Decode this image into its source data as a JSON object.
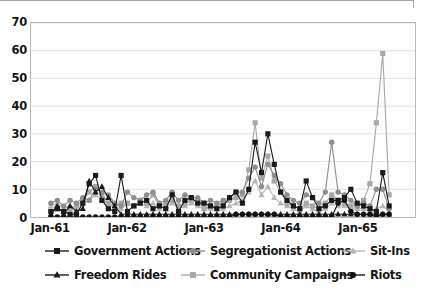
{
  "chart_data": {
    "type": "line",
    "title": "",
    "xlabel": "",
    "ylabel": "",
    "ylim": [
      0,
      70
    ],
    "ytick_step": 10,
    "yticks": [
      "0",
      "10",
      "20",
      "30",
      "40",
      "50",
      "60",
      "70"
    ],
    "xticks": [
      "Jan-61",
      "Jan-62",
      "Jan-63",
      "Jan-64",
      "Jan-65"
    ],
    "xtick_positions": [
      0,
      12,
      24,
      36,
      48
    ],
    "grid": "horizontal",
    "legend_position": "bottom",
    "x_range": [
      0,
      53
    ],
    "x_count": 54,
    "series": [
      {
        "name": "Government Actions",
        "marker": "square",
        "color": "#1a1a1a",
        "line_color": "#1a1a1a",
        "values": [
          2,
          3,
          2,
          1,
          1,
          5,
          12,
          15,
          6,
          3,
          2,
          15,
          2,
          4,
          5,
          6,
          3,
          4,
          3,
          8,
          2,
          6,
          7,
          5,
          5,
          4,
          3,
          4,
          7,
          9,
          5,
          10,
          27,
          16,
          30,
          19,
          9,
          6,
          4,
          3,
          13,
          7,
          3,
          4,
          6,
          6,
          7,
          10,
          5,
          4,
          3,
          2,
          16,
          4
        ]
      },
      {
        "name": "Segregationist Actions",
        "marker": "circle",
        "color": "#8e8e8e",
        "line_color": "#8e8e8e",
        "values": [
          5,
          6,
          4,
          6,
          5,
          7,
          6,
          10,
          9,
          8,
          5,
          4,
          9,
          7,
          6,
          8,
          9,
          5,
          6,
          9,
          6,
          8,
          7,
          7,
          5,
          6,
          5,
          6,
          7,
          9,
          9,
          14,
          18,
          11,
          19,
          15,
          12,
          8,
          6,
          5,
          8,
          7,
          5,
          9,
          27,
          9,
          8,
          6,
          4,
          5,
          4,
          10,
          10,
          3
        ]
      },
      {
        "name": "Sit-Ins",
        "marker": "triangle",
        "color": "#b6b6b6",
        "line_color": "#b6b6b6",
        "values": [
          4,
          5,
          3,
          4,
          3,
          5,
          6,
          8,
          6,
          5,
          3,
          3,
          5,
          4,
          5,
          4,
          5,
          3,
          4,
          5,
          3,
          4,
          5,
          4,
          3,
          3,
          3,
          3,
          4,
          5,
          6,
          9,
          13,
          8,
          11,
          7,
          5,
          4,
          3,
          2,
          4,
          3,
          2,
          3,
          5,
          4,
          4,
          3,
          3,
          3,
          2,
          3,
          4,
          2
        ]
      },
      {
        "name": "Freedom Rides",
        "marker": "triangle",
        "color": "#1a1a1a",
        "line_color": "#1a1a1a",
        "values": [
          1,
          4,
          1,
          4,
          2,
          3,
          13,
          9,
          11,
          7,
          4,
          1,
          1,
          1,
          1,
          1,
          1,
          1,
          1,
          1,
          1,
          1,
          1,
          1,
          1,
          1,
          1,
          1,
          1,
          1,
          1,
          1,
          1,
          1,
          1,
          1,
          1,
          1,
          1,
          1,
          1,
          1,
          1,
          1,
          1,
          1,
          1,
          1,
          1,
          1,
          1,
          1,
          1,
          1
        ]
      },
      {
        "name": "Community Campaigns",
        "marker": "square",
        "color": "#a8a8a8",
        "line_color": "#a8a8a8",
        "values": [
          2,
          3,
          2,
          3,
          4,
          6,
          9,
          11,
          8,
          5,
          4,
          5,
          5,
          4,
          6,
          5,
          8,
          4,
          5,
          6,
          4,
          5,
          6,
          6,
          3,
          4,
          4,
          5,
          6,
          7,
          8,
          17,
          34,
          14,
          22,
          13,
          9,
          5,
          4,
          3,
          5,
          4,
          3,
          5,
          8,
          6,
          5,
          4,
          4,
          6,
          12,
          34,
          59,
          8
        ]
      },
      {
        "name": "Riots",
        "marker": "circle",
        "color": "#111111",
        "line_color": "#111111",
        "values": [
          0,
          0,
          0,
          0,
          0,
          0,
          0,
          0,
          0,
          0,
          0,
          0,
          0,
          0,
          0,
          0,
          0,
          0,
          0,
          0,
          0,
          0,
          0,
          0,
          0,
          0,
          0,
          0,
          0,
          1,
          1,
          1,
          1,
          1,
          1,
          1,
          0,
          0,
          0,
          0,
          0,
          0,
          0,
          0,
          0,
          5,
          6,
          2,
          1,
          1,
          1,
          0,
          1,
          1
        ]
      }
    ]
  },
  "legend": {
    "items": [
      {
        "label": "Government Actions",
        "marker": "square",
        "color": "#1a1a1a"
      },
      {
        "label": "Segregationist Actions",
        "marker": "circle",
        "color": "#8e8e8e"
      },
      {
        "label": "Sit-Ins",
        "marker": "triangle",
        "color": "#b6b6b6"
      },
      {
        "label": "Freedom Rides",
        "marker": "triangle",
        "color": "#1a1a1a"
      },
      {
        "label": "Community Campaigns",
        "marker": "square",
        "color": "#a8a8a8"
      },
      {
        "label": "Riots",
        "marker": "circle",
        "color": "#111111"
      }
    ],
    "rows": [
      [
        0,
        1,
        2
      ],
      [
        3,
        4,
        5
      ]
    ],
    "column_offsets": [
      44,
      180,
      340
    ]
  },
  "colors": {
    "axis": "#b9b9b9",
    "grid": "#e4e4e4",
    "text": "#151515",
    "plot_background": "#fdfdfd",
    "page_background": "#ffffff"
  }
}
